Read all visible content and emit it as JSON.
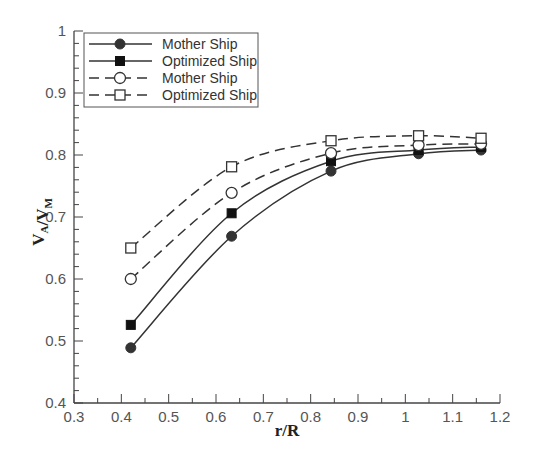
{
  "chart_data": {
    "type": "line",
    "title": "",
    "xlabel": "r/R",
    "ylabel": "V_A/V_M",
    "xlim": [
      0.3,
      1.2
    ],
    "ylim": [
      0.4,
      1.0
    ],
    "xticks": [
      0.3,
      0.4,
      0.5,
      0.6,
      0.7,
      0.8,
      0.9,
      1.0,
      1.1,
      1.2
    ],
    "xtick_labels": [
      "0.3",
      "0.4",
      "0.5",
      "0.6",
      "0.7",
      "0.8",
      "0.9",
      "1",
      "1.1",
      "1.2"
    ],
    "yticks": [
      0.4,
      0.5,
      0.6,
      0.7,
      0.8,
      0.9,
      1.0
    ],
    "ytick_labels": [
      "0.4",
      "0.5",
      "0.6",
      "0.7",
      "0.8",
      "0.9",
      "1"
    ],
    "grid": false,
    "legend_position": "upper left",
    "x": [
      0.42,
      0.633,
      0.843,
      1.028,
      1.16
    ],
    "series": [
      {
        "name": "Mother Ship",
        "line": "solid",
        "marker": "filled-circle",
        "values": [
          0.489,
          0.669,
          0.774,
          0.802,
          0.808
        ]
      },
      {
        "name": "Optimized Ship",
        "line": "solid",
        "marker": "filled-square",
        "values": [
          0.526,
          0.706,
          0.79,
          0.808,
          0.813
        ]
      },
      {
        "name": "Mother Ship",
        "line": "dashed",
        "marker": "open-circle",
        "values": [
          0.6,
          0.739,
          0.803,
          0.816,
          0.818
        ]
      },
      {
        "name": "Optimized Ship",
        "line": "dashed",
        "marker": "open-square",
        "values": [
          0.65,
          0.781,
          0.823,
          0.831,
          0.827
        ]
      }
    ]
  },
  "colors": {
    "line": "#333333",
    "marker": "#333333",
    "axis": "#444444",
    "background": "#ffffff"
  }
}
